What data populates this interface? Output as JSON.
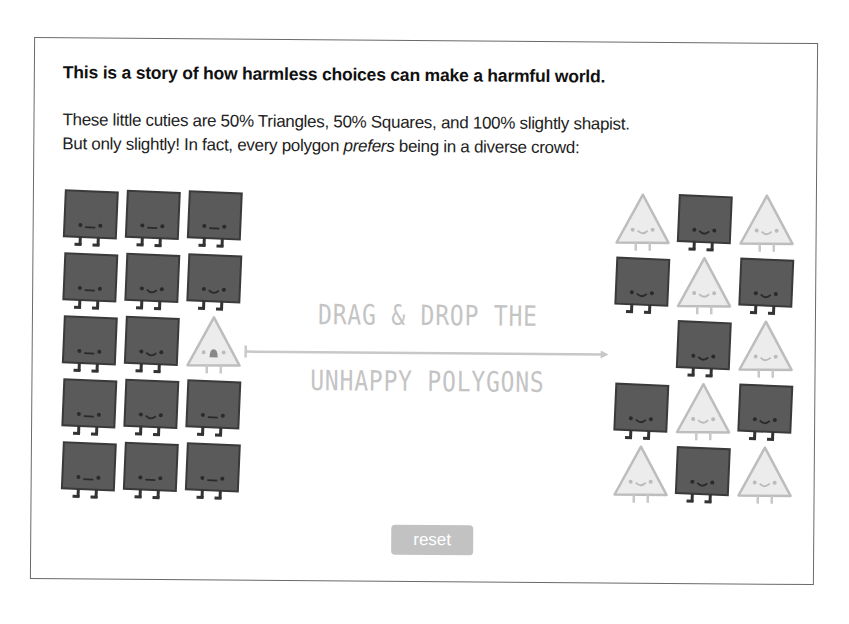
{
  "story": {
    "title": "This is a story of how harmless choices can make a harmful world.",
    "line1": "These little cuties are 50% Triangles, 50% Squares, and 100% slightly shapist.",
    "line2_before": "But only slightly! In fact, every polygon ",
    "line2_em": "prefers",
    "line2_after": " being in a diverse crowd:"
  },
  "instructions": {
    "line1": "DRAG & DROP THE",
    "line2": "UNHAPPY POLYGONS"
  },
  "controls": {
    "reset_label": "reset"
  },
  "colors": {
    "square_fill": "#5a5a5a",
    "square_stroke": "#3a3a3a",
    "triangle_fill": "#ececec",
    "triangle_stroke": "#bdbdbd",
    "instruction_text": "#c4c4c4",
    "reset_bg": "#c2c2c2"
  },
  "left_grid": {
    "rows": [
      [
        "square:meh",
        "square:meh",
        "square:meh"
      ],
      [
        "square:meh",
        "square:happy",
        "square:happy"
      ],
      [
        "square:meh",
        "square:happy",
        "triangle:unhappy"
      ],
      [
        "square:meh",
        "square:happy",
        "square:meh"
      ],
      [
        "square:meh",
        "square:meh",
        "square:meh"
      ]
    ]
  },
  "right_grid": {
    "rows": [
      [
        "triangle:happy",
        "square:happy",
        "triangle:happy"
      ],
      [
        "square:happy",
        "triangle:happy",
        "square:happy"
      ],
      [
        "empty",
        "square:happy",
        "triangle:happy"
      ],
      [
        "square:happy",
        "triangle:happy",
        "square:happy"
      ],
      [
        "triangle:happy",
        "square:happy",
        "triangle:happy"
      ]
    ]
  }
}
